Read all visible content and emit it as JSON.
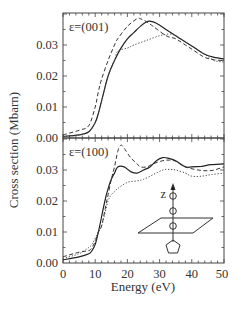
{
  "chart_data": {
    "type": "line",
    "xlabel": "Energy (eV)",
    "ylabel": "Cross section (Mbarn)",
    "xlim": [
      0,
      50
    ],
    "x_ticks": [
      "0",
      "10",
      "20",
      "30",
      "40",
      "50"
    ],
    "grid": false,
    "legend": null,
    "panels": [
      {
        "label": "ε=(001)",
        "ylim": [
          0.0,
          0.04
        ],
        "y_ticks": [
          "0.00",
          "0.01",
          "0.02",
          "0.03"
        ],
        "series": [
          {
            "name": "solid",
            "style": "solid",
            "x": [
              0,
              5,
              8,
              10,
              11,
              12,
              14,
              16,
              18,
              20,
              22,
              24,
              26,
              27,
              29,
              32,
              35,
              38,
              41,
              44,
              47,
              50
            ],
            "y": [
              0.0005,
              0.001,
              0.002,
              0.005,
              0.008,
              0.012,
              0.02,
              0.025,
              0.029,
              0.032,
              0.034,
              0.036,
              0.0375,
              0.0377,
              0.037,
              0.035,
              0.033,
              0.031,
              0.029,
              0.027,
              0.026,
              0.0255
            ]
          },
          {
            "name": "dashed",
            "style": "dashed",
            "x": [
              0,
              5,
              8,
              10,
              11,
              12,
              14,
              16,
              17,
              20,
              23,
              24,
              26,
              28,
              32,
              35,
              38,
              41,
              44,
              47,
              50
            ],
            "y": [
              0.001,
              0.0025,
              0.004,
              0.01,
              0.015,
              0.019,
              0.025,
              0.03,
              0.032,
              0.036,
              0.0385,
              0.0385,
              0.0375,
              0.036,
              0.033,
              0.032,
              0.03,
              0.028,
              0.026,
              0.0252,
              0.025
            ]
          },
          {
            "name": "dotted",
            "style": "dotted",
            "x": [
              0,
              5,
              8,
              10,
              11,
              12,
              14,
              16,
              17,
              20,
              22,
              26,
              30,
              33,
              35,
              38,
              41,
              44,
              47,
              50
            ],
            "y": [
              0.0005,
              0.001,
              0.002,
              0.005,
              0.008,
              0.012,
              0.02,
              0.025,
              0.028,
              0.029,
              0.03,
              0.0315,
              0.033,
              0.0335,
              0.033,
              0.031,
              0.029,
              0.027,
              0.025,
              0.0245
            ]
          }
        ]
      },
      {
        "label": "ε=(100)",
        "ylim": [
          0.0,
          0.0405
        ],
        "y_ticks": [
          "0.00",
          "0.01",
          "0.02",
          "0.03"
        ],
        "series": [
          {
            "name": "solid",
            "style": "solid",
            "x": [
              0,
              5,
              8,
              9,
              10,
              11,
              12,
              13,
              14,
              15,
              16,
              17,
              19,
              21,
              23,
              25,
              27,
              29,
              31,
              33,
              35,
              38,
              40,
              43,
              46,
              50
            ],
            "y": [
              0.001,
              0.002,
              0.003,
              0.004,
              0.006,
              0.01,
              0.015,
              0.02,
              0.024,
              0.027,
              0.029,
              0.031,
              0.031,
              0.0295,
              0.029,
              0.03,
              0.031,
              0.033,
              0.034,
              0.0337,
              0.033,
              0.031,
              0.031,
              0.0312,
              0.0317,
              0.032
            ]
          },
          {
            "name": "dashed",
            "style": "dashed",
            "x": [
              0,
              5,
              8,
              9,
              10,
              11,
              12,
              13,
              14,
              15,
              16,
              17,
              18,
              19,
              21,
              23,
              24,
              26,
              28,
              31,
              33,
              35,
              38,
              42,
              46,
              50
            ],
            "y": [
              0.002,
              0.0035,
              0.004,
              0.005,
              0.007,
              0.01,
              0.012,
              0.017,
              0.022,
              0.027,
              0.031,
              0.036,
              0.038,
              0.037,
              0.034,
              0.032,
              0.031,
              0.031,
              0.032,
              0.033,
              0.0332,
              0.0328,
              0.031,
              0.03,
              0.0298,
              0.031
            ]
          },
          {
            "name": "dotted",
            "style": "dotted",
            "x": [
              0,
              5,
              8,
              9,
              10,
              11,
              12,
              13,
              14,
              15,
              17,
              20,
              23,
              25,
              28,
              31,
              33,
              35,
              38,
              40,
              43,
              46,
              50
            ],
            "y": [
              0.0015,
              0.003,
              0.005,
              0.006,
              0.008,
              0.01,
              0.012,
              0.016,
              0.02,
              0.022,
              0.024,
              0.026,
              0.0265,
              0.027,
              0.0285,
              0.03,
              0.0302,
              0.03,
              0.029,
              0.028,
              0.028,
              0.0285,
              0.029
            ]
          }
        ]
      }
    ],
    "annotations": [
      {
        "type": "inset-diagram",
        "description": "molecular axis z above a surface plane with chain of circles and a pentagon ring",
        "axis_label": "z"
      }
    ]
  },
  "labels": {
    "ylabel": "Cross section (Mbarn)",
    "xlabel": "Energy (eV)",
    "panel_top": "ε=(001)",
    "panel_bottom": "ε=(100)",
    "inset_axis": "z",
    "xticks": [
      "0",
      "10",
      "20",
      "30",
      "40",
      "50"
    ],
    "yticks_top": [
      "0.00",
      "0.01",
      "0.02",
      "0.03"
    ],
    "yticks_bottom": [
      "0.00",
      "0.01",
      "0.02",
      "0.03"
    ]
  }
}
